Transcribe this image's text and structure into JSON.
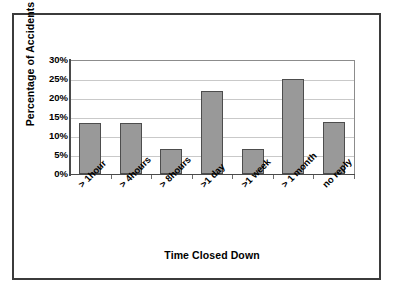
{
  "chart_data": {
    "type": "bar",
    "title": "",
    "xlabel": "Time Closed Down",
    "ylabel": "Percentage of Accidents",
    "categories": [
      "> 1hour",
      "> 4hours",
      "> 8hours",
      ">1 day",
      ">1  week",
      "> 1 month",
      "no reply"
    ],
    "values": [
      13.4,
      13.5,
      6.6,
      21.8,
      6.7,
      25.0,
      13.7
    ],
    "ylim": [
      0,
      30
    ],
    "yticks": [
      0,
      5,
      10,
      15,
      20,
      25,
      30
    ],
    "ytick_labels": [
      "0%",
      "5%",
      "10%",
      "15%",
      "20%",
      "25%",
      "30%"
    ],
    "grid": true,
    "legend": false,
    "series_name": "Percentage of Accidents",
    "bar_color": "#999999",
    "bar_edge_color": "#4d4d4d",
    "gridline_color": "#c9c9c9",
    "axis_color": "#4a4a4a",
    "frame_color": "#3b3b3b"
  }
}
